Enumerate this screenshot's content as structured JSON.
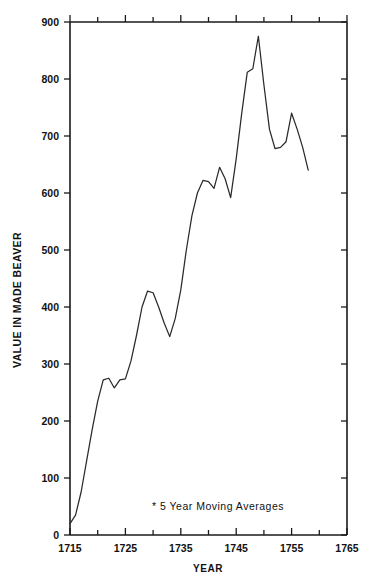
{
  "chart_data": {
    "type": "line",
    "title": "",
    "subtitle": "",
    "xlabel": "YEAR",
    "ylabel": "VALUE IN MADE BEAVER",
    "xlim": [
      1715,
      1765
    ],
    "ylim": [
      0,
      900
    ],
    "grid": false,
    "legend": "none",
    "annotation": "* 5 Year Moving Averages",
    "x_ticklabels": [
      "1715",
      "1725",
      "1735",
      "1745",
      "1755",
      "1765"
    ],
    "x_ticklabel_values": [
      1715,
      1725,
      1735,
      1745,
      1755,
      1765
    ],
    "x_minor_tick_values": [
      1720,
      1730,
      1740,
      1750,
      1760
    ],
    "y_ticklabels": [
      "0",
      "100",
      "200",
      "300",
      "400",
      "500",
      "600",
      "700",
      "800",
      "900"
    ],
    "y_ticklabel_values": [
      0,
      100,
      200,
      300,
      400,
      500,
      600,
      700,
      800,
      900
    ],
    "series": [
      {
        "name": "Value in Made Beaver (5 year moving average)",
        "color": "#2a2a2a",
        "x": [
          1715,
          1716,
          1717,
          1718,
          1719,
          1720,
          1721,
          1722,
          1723,
          1724,
          1725,
          1726,
          1727,
          1728,
          1729,
          1730,
          1731,
          1732,
          1733,
          1734,
          1735,
          1736,
          1737,
          1738,
          1739,
          1740,
          1741,
          1742,
          1743,
          1744,
          1745,
          1746,
          1747,
          1748,
          1749,
          1750,
          1751,
          1752,
          1753,
          1754,
          1755,
          1756,
          1757,
          1758
        ],
        "y": [
          20,
          35,
          75,
          130,
          185,
          235,
          272,
          275,
          258,
          272,
          274,
          305,
          350,
          400,
          428,
          425,
          400,
          372,
          348,
          380,
          430,
          500,
          560,
          600,
          622,
          620,
          608,
          645,
          625,
          592,
          660,
          740,
          812,
          818,
          875,
          790,
          712,
          678,
          680,
          690,
          740,
          712,
          680,
          640
        ]
      }
    ]
  },
  "axes": {
    "y_axis_title": "VALUE IN MADE BEAVER",
    "x_axis_title": "YEAR"
  },
  "annotations": {
    "moving_average_note": "* 5 Year Moving Averages"
  }
}
